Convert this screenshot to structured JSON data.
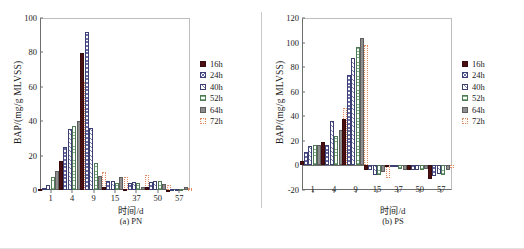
{
  "figure": {
    "panels": [
      {
        "caption": "(a) PN",
        "xlabel": "时间/d",
        "ylabel": "BAP/(mg/g MLVSS)",
        "chart_data": {
          "type": "bar",
          "title": "(a) PN",
          "xlabel": "时间/d",
          "ylabel": "BAP/(mg/g MLVSS)",
          "ylim": [
            0,
            100
          ],
          "yticks": [
            0,
            20,
            40,
            60,
            80,
            100
          ],
          "grid": false,
          "legend_position": "right",
          "categories": [
            "1",
            "4",
            "9",
            "15",
            "37",
            "50",
            "57"
          ],
          "series": [
            {
              "name": "16h",
              "color": "#4a0f10",
              "values": [
                0.4,
                17.0,
                79.8,
                1.5,
                0.5,
                1.8,
                0.2
              ]
            },
            {
              "name": "24h",
              "color": "#6b6ea6",
              "values": [
                1.0,
                25.0,
                92.0,
                5.0,
                4.0,
                4.5,
                0.5
              ]
            },
            {
              "name": "40h",
              "color": "#7d80b3",
              "values": [
                3.0,
                35.5,
                36.0,
                5.5,
                4.5,
                5.0,
                0.6
              ]
            },
            {
              "name": "52h",
              "color": "#7fae86",
              "values": [
                7.5,
                37.0,
                15.8,
                4.0,
                4.0,
                5.2,
                0.5
              ]
            },
            {
              "name": "64h",
              "color": "#8e8e8e",
              "values": [
                10.8,
                40.0,
                8.0,
                7.5,
                2.0,
                3.5,
                2.0
              ]
            },
            {
              "name": "72h",
              "color": "#e08b63",
              "values": [
                13.5,
                63.0,
                10.5,
                7.5,
                9.0,
                2.8,
                1.0
              ]
            }
          ]
        }
      },
      {
        "caption": "(b) PS",
        "xlabel": "时间/d",
        "ylabel": "BAP/(mg/g MLVSS)",
        "chart_data": {
          "type": "bar",
          "title": "(b) PS",
          "xlabel": "时间/d",
          "ylabel": "BAP/(mg/g MLVSS)",
          "ylim": [
            -20,
            120
          ],
          "yticks": [
            -20,
            0,
            20,
            40,
            60,
            80,
            100,
            120
          ],
          "grid": false,
          "legend_position": "right",
          "categories": [
            "1",
            "4",
            "9",
            "15",
            "37",
            "50",
            "57"
          ],
          "series": [
            {
              "name": "16h",
              "color": "#4a0f10",
              "values": [
                4.0,
                19.0,
                37.5,
                -3.5,
                -1.0,
                -3.5,
                -11.0
              ]
            },
            {
              "name": "24h",
              "color": "#6b6ea6",
              "values": [
                11.0,
                17.0,
                73.5,
                -3.5,
                -1.5,
                -3.5,
                -9.0
              ]
            },
            {
              "name": "40h",
              "color": "#7d80b3",
              "values": [
                15.5,
                36.0,
                87.5,
                -7.5,
                -1.5,
                -3.5,
                -7.0
              ]
            },
            {
              "name": "52h",
              "color": "#7fae86",
              "values": [
                17.0,
                24.0,
                96.0,
                -7.5,
                -3.0,
                -4.0,
                -7.5
              ]
            },
            {
              "name": "64h",
              "color": "#8e8e8e",
              "values": [
                17.0,
                29.0,
                103.5,
                -5.0,
                -3.5,
                -3.0,
                -4.0
              ]
            },
            {
              "name": "72h",
              "color": "#e08b63",
              "values": [
                10.5,
                47.0,
                98.0,
                -10.5,
                -0.5,
                -7.5,
                -2.0
              ]
            }
          ]
        }
      }
    ],
    "legend": [
      {
        "label": "16h",
        "key": "s16"
      },
      {
        "label": "24h",
        "key": "s24"
      },
      {
        "label": "40h",
        "key": "s40"
      },
      {
        "label": "52h",
        "key": "s52"
      },
      {
        "label": "64h",
        "key": "s64"
      },
      {
        "label": "72h",
        "key": "s72"
      }
    ]
  }
}
